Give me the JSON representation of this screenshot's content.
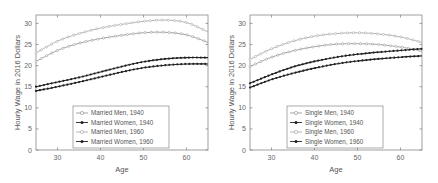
{
  "chart_data": [
    {
      "type": "line",
      "title": "",
      "xlabel": "Age",
      "ylabel": "Hourly Wage in 2016 Dollars",
      "xlim": [
        25,
        65
      ],
      "ylim": [
        0,
        32
      ],
      "xticks": [
        30,
        40,
        50,
        60
      ],
      "yticks": [
        0,
        5,
        10,
        15,
        20,
        25,
        30
      ],
      "grid": false,
      "legend_position": "lower center",
      "series_year_assignment_note": "Legend markers do not distinguish 1940 from 1960; higher curve in each pair assumed to be 1960.",
      "x": [
        25,
        30,
        35,
        40,
        45,
        50,
        55,
        60,
        65
      ],
      "series": [
        {
          "name": "Married Men, 1940",
          "marker": "open-circle",
          "color": "#9a9a9a",
          "values": [
            21.0,
            23.6,
            25.3,
            26.4,
            27.2,
            27.8,
            27.9,
            27.3,
            25.5
          ]
        },
        {
          "name": "Married Women, 1940",
          "marker": "filled-dot",
          "color": "#222222",
          "values": [
            14.0,
            15.0,
            16.1,
            17.3,
            18.5,
            19.5,
            20.1,
            20.4,
            20.4
          ]
        },
        {
          "name": "Married Men, 1960",
          "marker": "open-circle",
          "color": "#aaaaaa",
          "values": [
            23.0,
            25.8,
            27.6,
            28.9,
            29.8,
            30.5,
            30.8,
            30.2,
            28.0
          ]
        },
        {
          "name": "Married Women, 1960",
          "marker": "filled-dot",
          "color": "#222222",
          "values": [
            15.0,
            16.1,
            17.2,
            18.5,
            19.8,
            20.9,
            21.6,
            21.9,
            21.9
          ]
        }
      ]
    },
    {
      "type": "line",
      "title": "",
      "xlabel": "Age",
      "ylabel": "Hourly Wage in 2016 Dollars",
      "xlim": [
        25,
        65
      ],
      "ylim": [
        0,
        32
      ],
      "xticks": [
        30,
        40,
        50,
        60
      ],
      "yticks": [
        0,
        5,
        10,
        15,
        20,
        25,
        30
      ],
      "grid": false,
      "legend_position": "lower center",
      "series_year_assignment_note": "Legend markers do not distinguish 1940 from 1960; higher curve in each pair assumed to be 1960.",
      "x": [
        25,
        30,
        35,
        40,
        45,
        50,
        55,
        60,
        65
      ],
      "series": [
        {
          "name": "Single Men, 1940",
          "marker": "open-circle",
          "color": "#9a9a9a",
          "values": [
            19.8,
            22.0,
            23.5,
            24.5,
            25.1,
            25.2,
            25.0,
            24.4,
            23.5
          ]
        },
        {
          "name": "Single Women, 1940",
          "marker": "filled-dot",
          "color": "#222222",
          "values": [
            14.8,
            16.7,
            18.2,
            19.4,
            20.4,
            21.1,
            21.6,
            22.0,
            22.3
          ]
        },
        {
          "name": "Single Men, 1960",
          "marker": "open-circle",
          "color": "#aaaaaa",
          "values": [
            21.5,
            24.0,
            25.8,
            27.0,
            27.6,
            27.8,
            27.5,
            26.8,
            25.5
          ]
        },
        {
          "name": "Single Women, 1960",
          "marker": "filled-dot",
          "color": "#222222",
          "values": [
            15.8,
            17.9,
            19.7,
            21.0,
            22.0,
            22.7,
            23.2,
            23.6,
            24.0
          ]
        }
      ]
    }
  ],
  "panels": [
    {
      "xlabel": "Age",
      "ylabel": "Hourly Wage in 2016 Dollars",
      "legend": [
        "Married Men, 1940",
        "Married Women, 1940",
        "Married Men, 1960",
        "Married Women, 1960"
      ]
    },
    {
      "xlabel": "Age",
      "ylabel": "Hourly Wage in 2016 Dollars",
      "legend": [
        "Single Men, 1940",
        "Single Women, 1940",
        "Single Men, 1960",
        "Single Women, 1960"
      ]
    }
  ]
}
